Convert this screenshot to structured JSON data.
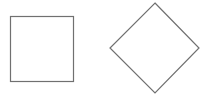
{
  "canvas": {
    "width": 211,
    "height": 97,
    "background": "#ffffff"
  },
  "shapes": [
    {
      "type": "square",
      "x": 10.5,
      "y": 16.5,
      "width": 63,
      "height": 65,
      "stroke": "#707070",
      "fill": "#ffffff"
    },
    {
      "type": "diamond",
      "points": "155,3 199,48 155,93 110,48",
      "stroke": "#707070",
      "fill": "#ffffff"
    }
  ]
}
